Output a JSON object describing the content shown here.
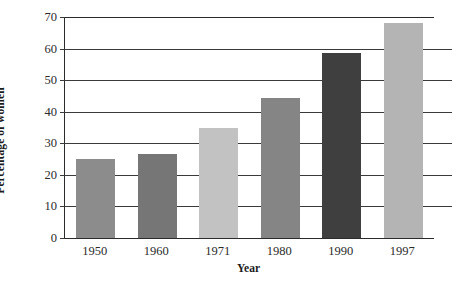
{
  "chart_data": {
    "type": "bar",
    "title": "",
    "subtitle": "",
    "xlabel": "Year",
    "ylabel": "Percentage of women",
    "categories": [
      "1950",
      "1960",
      "1971",
      "1980",
      "1990",
      "1997"
    ],
    "values": [
      25,
      26.5,
      35,
      44.5,
      58.5,
      68
    ],
    "series": [
      {
        "name": "Percentage of women",
        "values": [
          25,
          26.5,
          35,
          44.5,
          58.5,
          68
        ]
      }
    ],
    "ylim": [
      0,
      70
    ],
    "xlim": [
      0,
      6
    ],
    "yticks": [
      0,
      10,
      20,
      30,
      40,
      50,
      60,
      70
    ],
    "ytick_labels": [
      "0",
      "10",
      "20",
      "30",
      "40",
      "50",
      "60",
      "70"
    ],
    "grid": true,
    "grid_axis": "y",
    "legend": false,
    "legend_position": "none",
    "bar_colors": [
      "#8c8c8c",
      "#767676",
      "#c2c2c2",
      "#858585",
      "#3f3f3f",
      "#b4b4b4"
    ],
    "axis_color": "#2b2b2b",
    "grid_color": "#3a3a3a",
    "background": "#ffffff",
    "annotations": []
  }
}
